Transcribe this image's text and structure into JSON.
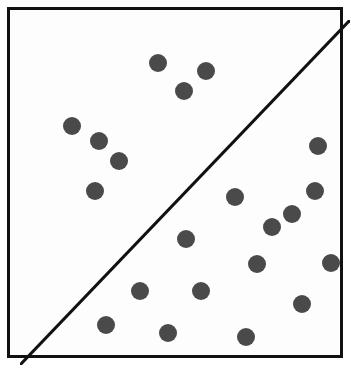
{
  "figure": {
    "title": "",
    "width": 351,
    "height": 371,
    "background_color": "#ffffff",
    "panel_background_color": "#fdfdfd",
    "border_color": "#111111",
    "border_width": 3,
    "dot_color": "#4a4a4a",
    "dot_diameter": 18,
    "divider_color": "#111111",
    "divider_width": 3
  },
  "chart_data": {
    "type": "scatter",
    "title": "",
    "subtitle": "",
    "xlabel": "",
    "ylabel": "",
    "xlim": [
      0,
      330
    ],
    "ylim": [
      0,
      345
    ],
    "grid": false,
    "legend": "none",
    "annotations": [
      {
        "name": "diagonal-divider",
        "kind": "line",
        "from": [
          0,
          345
        ],
        "to": [
          330,
          0
        ],
        "color": "#111111",
        "width": 3,
        "description": "diagonal line from bottom-left corner to top-right corner splitting the square into two triangles"
      }
    ],
    "total_points": 21,
    "groups": [
      {
        "name": "above-diagonal",
        "count": 7,
        "region": "upper-left triangle"
      },
      {
        "name": "below-diagonal",
        "count": 14,
        "region": "lower-right triangle"
      }
    ],
    "points": [
      {
        "id": 1,
        "x": 138,
        "y": 43,
        "group": "above-diagonal"
      },
      {
        "id": 2,
        "x": 186,
        "y": 51,
        "group": "above-diagonal"
      },
      {
        "id": 3,
        "x": 164,
        "y": 71,
        "group": "above-diagonal"
      },
      {
        "id": 4,
        "x": 52,
        "y": 106,
        "group": "above-diagonal"
      },
      {
        "id": 5,
        "x": 79,
        "y": 121,
        "group": "above-diagonal"
      },
      {
        "id": 6,
        "x": 99,
        "y": 141,
        "group": "above-diagonal"
      },
      {
        "id": 7,
        "x": 75,
        "y": 171,
        "group": "above-diagonal"
      },
      {
        "id": 8,
        "x": 298,
        "y": 126,
        "group": "below-diagonal"
      },
      {
        "id": 9,
        "x": 215,
        "y": 177,
        "group": "below-diagonal"
      },
      {
        "id": 10,
        "x": 295,
        "y": 171,
        "group": "below-diagonal"
      },
      {
        "id": 11,
        "x": 272,
        "y": 194,
        "group": "below-diagonal"
      },
      {
        "id": 12,
        "x": 166,
        "y": 219,
        "group": "below-diagonal"
      },
      {
        "id": 13,
        "x": 237,
        "y": 244,
        "group": "below-diagonal"
      },
      {
        "id": 14,
        "x": 311,
        "y": 243,
        "group": "below-diagonal"
      },
      {
        "id": 15,
        "x": 120,
        "y": 271,
        "group": "below-diagonal"
      },
      {
        "id": 16,
        "x": 181,
        "y": 271,
        "group": "below-diagonal"
      },
      {
        "id": 17,
        "x": 282,
        "y": 284,
        "group": "below-diagonal"
      },
      {
        "id": 18,
        "x": 86,
        "y": 305,
        "group": "below-diagonal"
      },
      {
        "id": 19,
        "x": 148,
        "y": 313,
        "group": "below-diagonal"
      },
      {
        "id": 20,
        "x": 226,
        "y": 317,
        "group": "below-diagonal"
      },
      {
        "id": 21,
        "x": 252,
        "y": 207,
        "group": "below-diagonal"
      }
    ]
  }
}
